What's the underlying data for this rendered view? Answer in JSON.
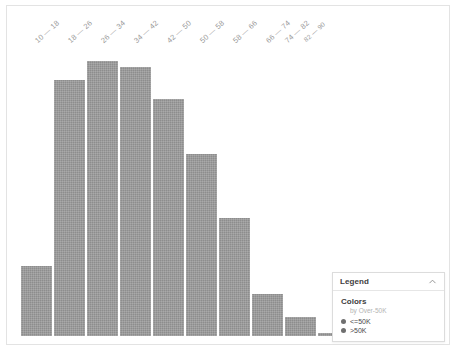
{
  "chart_data": {
    "type": "bar",
    "title": "",
    "xlabel": "",
    "ylabel": "",
    "grid": false,
    "ylim": [
      0,
      100
    ],
    "categories": [
      "10 — 18",
      "18 — 26",
      "26 — 34",
      "34 — 42",
      "42 — 50",
      "50 — 58",
      "58 — 66",
      "66 — 74",
      "74 — 82",
      "82 — 90"
    ],
    "values": [
      22,
      80,
      86,
      84,
      74,
      57,
      37,
      13,
      6,
      1
    ],
    "series": [
      {
        "name": "<=50K",
        "values": [
          22,
          80,
          86,
          84,
          74,
          57,
          37,
          13,
          6,
          1
        ]
      }
    ],
    "legend_position": "bottom-right",
    "bar_color": "#8d8d8d"
  },
  "ticks": [
    {
      "label": "10 — 18"
    },
    {
      "label": "18 — 26"
    },
    {
      "label": "26 — 34"
    },
    {
      "label": "34 — 42"
    },
    {
      "label": "42 — 50"
    },
    {
      "label": "50 — 58"
    },
    {
      "label": "58 — 66"
    },
    {
      "label": "66 — 74"
    },
    {
      "label": "74 — 82"
    },
    {
      "label": "82 — 90"
    }
  ],
  "legend": {
    "title": "Legend",
    "collapse_icon": "chevron-up-icon",
    "section_title": "Colors",
    "subtitle": "by Over-50K",
    "items": [
      {
        "label": "<=50K",
        "color": "#6f6f6f"
      },
      {
        "label": ">50K",
        "color": "#6f6f6f"
      }
    ]
  }
}
